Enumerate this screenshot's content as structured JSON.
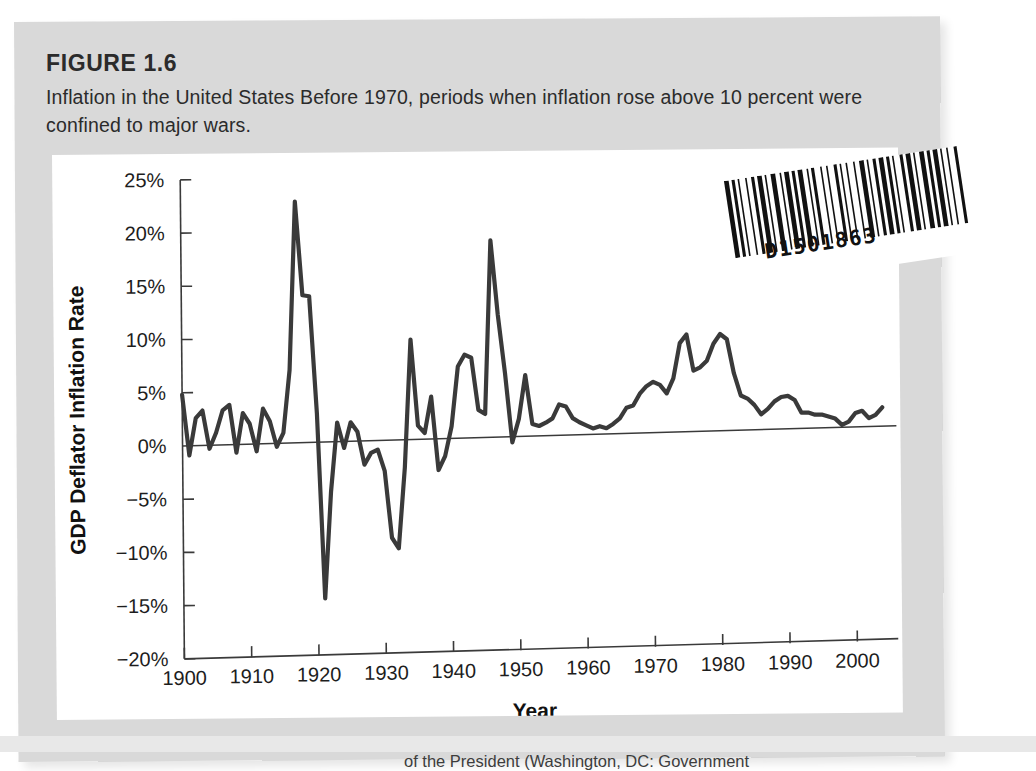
{
  "figure": {
    "label": "FIGURE 1.6",
    "caption": "Inflation in the United States Before 1970, periods when inflation rose above 10 percent were confined to major wars."
  },
  "barcode": {
    "number": "D1501863"
  },
  "source_note": "of the President (Washington, DC: Government",
  "colors": {
    "page_background": "#d9d9d9",
    "panel_background": "#ffffff",
    "line": "#3a3a3a",
    "text": "#2b2b2b"
  },
  "chart_data": {
    "type": "line",
    "title": "Inflation in the United States",
    "xlabel": "Year",
    "ylabel": "GDP Deflator Inflation Rate",
    "xlim": [
      1900,
      2004
    ],
    "ylim": [
      -20,
      25
    ],
    "ytick_labels": [
      "25%",
      "20%",
      "15%",
      "10%",
      "5%",
      "0%",
      "−5%",
      "−10%",
      "−15%",
      "−20%"
    ],
    "ytick_values": [
      25,
      20,
      15,
      10,
      5,
      0,
      -5,
      -10,
      -15,
      -20
    ],
    "xtick_labels": [
      "1900",
      "1910",
      "1920",
      "1930",
      "1940",
      "1950",
      "1960",
      "1970",
      "1980",
      "1990",
      "2000"
    ],
    "xtick_values": [
      1900,
      1910,
      1920,
      1930,
      1940,
      1950,
      1960,
      1970,
      1980,
      1990,
      2000
    ],
    "grid": false,
    "legend": false,
    "zero_reference_line": true,
    "series": [
      {
        "name": "GDP Deflator Inflation Rate",
        "x": [
          1900,
          1901,
          1902,
          1903,
          1904,
          1905,
          1906,
          1907,
          1908,
          1909,
          1910,
          1911,
          1912,
          1913,
          1914,
          1915,
          1916,
          1917,
          1918,
          1919,
          1920,
          1921,
          1922,
          1923,
          1924,
          1925,
          1926,
          1927,
          1928,
          1929,
          1930,
          1931,
          1932,
          1933,
          1934,
          1935,
          1936,
          1937,
          1938,
          1939,
          1940,
          1941,
          1942,
          1943,
          1944,
          1945,
          1946,
          1947,
          1948,
          1949,
          1950,
          1951,
          1952,
          1953,
          1954,
          1955,
          1956,
          1957,
          1958,
          1959,
          1960,
          1961,
          1962,
          1963,
          1964,
          1965,
          1966,
          1967,
          1968,
          1969,
          1970,
          1971,
          1972,
          1973,
          1974,
          1975,
          1976,
          1977,
          1978,
          1979,
          1980,
          1981,
          1982,
          1983,
          1984,
          1985,
          1986,
          1987,
          1988,
          1989,
          1990,
          1991,
          1992,
          1993,
          1994,
          1995,
          1996,
          1997,
          1998,
          1999,
          2000,
          2001,
          2002,
          2003,
          2004
        ],
        "values": [
          4.8,
          -0.9,
          2.6,
          3.3,
          -0.3,
          1.2,
          3.3,
          3.8,
          -0.7,
          3.0,
          2.0,
          -0.6,
          3.4,
          2.2,
          -0.2,
          1.1,
          7.0,
          22.8,
          14.0,
          13.9,
          2.9,
          -14.5,
          -4.5,
          2.0,
          -0.4,
          2.0,
          1.1,
          -2.0,
          -0.9,
          -0.6,
          -2.6,
          -8.9,
          -9.9,
          -2.3,
          9.7,
          1.6,
          0.9,
          4.3,
          -2.6,
          -1.3,
          1.5,
          7.1,
          8.2,
          7.9,
          3.0,
          2.6,
          18.9,
          11.9,
          6.4,
          -0.1,
          2.1,
          6.2,
          1.6,
          1.4,
          1.7,
          2.1,
          3.4,
          3.2,
          2.1,
          1.7,
          1.4,
          1.1,
          1.3,
          1.1,
          1.5,
          2.0,
          3.0,
          3.2,
          4.3,
          5.0,
          5.4,
          5.1,
          4.3,
          5.7,
          9.0,
          9.8,
          6.4,
          6.7,
          7.3,
          8.9,
          9.8,
          9.3,
          6.1,
          4.0,
          3.7,
          3.1,
          2.2,
          2.7,
          3.4,
          3.8,
          3.9,
          3.5,
          2.3,
          2.3,
          2.1,
          2.1,
          1.9,
          1.7,
          1.1,
          1.4,
          2.2,
          2.4,
          1.7,
          2.0,
          2.7
        ]
      }
    ]
  }
}
